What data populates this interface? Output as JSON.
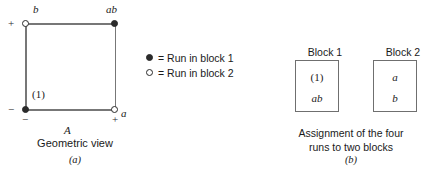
{
  "figure": {
    "type": "2^2 factorial design blocked into two blocks",
    "panel_a": {
      "caption_title": "Geometric view",
      "panel_letter": "(a)",
      "axis_label": "A",
      "corners": [
        {
          "position": "top-left",
          "label": "b",
          "marker": "open-circle",
          "block": 2,
          "sign_left": "−",
          "sign_vertical": "+"
        },
        {
          "position": "top-right",
          "label": "ab",
          "marker": "filled-circle",
          "block": 1
        },
        {
          "position": "bottom-left",
          "label": "(1)",
          "marker": "filled-circle",
          "block": 1,
          "sign_left": "−",
          "sign_below": "−"
        },
        {
          "position": "bottom-right",
          "label": "a",
          "marker": "open-circle",
          "block": 2,
          "sign_below": "+"
        }
      ],
      "signs": {
        "left_top": "+",
        "left_bottom": "−",
        "bottom_left": "−",
        "bottom_right": "+"
      }
    },
    "legend": {
      "items": [
        {
          "marker": "filled-circle",
          "text": "= Run in block 1"
        },
        {
          "marker": "open-circle",
          "text": "= Run in block 2"
        }
      ]
    },
    "panel_b": {
      "panel_letter": "(b)",
      "caption_line1": "Assignment of the four",
      "caption_line2": "runs to two blocks",
      "blocks": [
        {
          "header": "Block 1",
          "runs": [
            "(1)",
            "ab"
          ]
        },
        {
          "header": "Block 2",
          "runs": [
            "a",
            "b"
          ]
        }
      ]
    },
    "colors": {
      "line": "#777777",
      "marker_stroke": "#2a2a2a",
      "marker_fill": "#2b2b2b",
      "box_border": "#6f6f6f",
      "text": "#1a1a1a",
      "background": "#ffffff"
    }
  }
}
